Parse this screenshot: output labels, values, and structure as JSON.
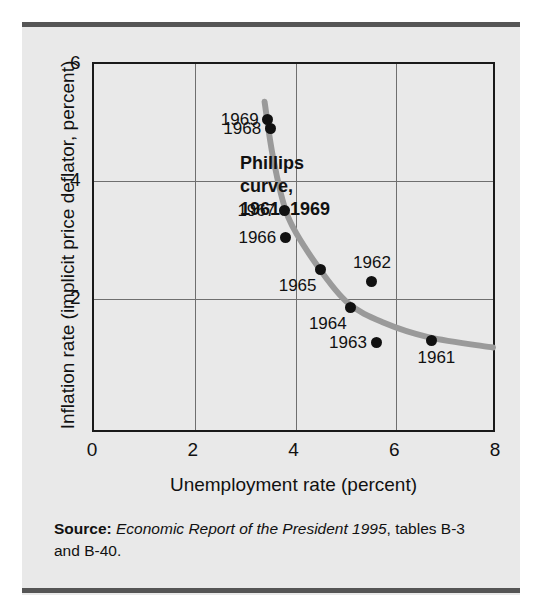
{
  "figure": {
    "source_note": {
      "lead": "Source:",
      "title": "Economic Report of the President 1995",
      "rest": ", tables B-3 and B-40."
    }
  },
  "chart_data": {
    "type": "scatter",
    "title": "",
    "xlabel": "Unemployment rate (percent)",
    "ylabel": "Inflation rate (implicit price deflator, percent)",
    "xlim": [
      0,
      8
    ],
    "ylim": [
      0,
      6
    ],
    "xticks": [
      0,
      2,
      4,
      6,
      8
    ],
    "yticks": [
      2,
      4,
      6
    ],
    "xtick_labels": [
      "0",
      "2",
      "4",
      "6",
      "8"
    ],
    "ytick_labels": [
      "2",
      "4",
      "6"
    ],
    "grid": true,
    "legend": "none",
    "annotations": [
      {
        "name": "phillips-curve-annotation",
        "lines": [
          "Phillips",
          "curve,",
          "1961–1969"
        ],
        "x": 4.5,
        "y": 4.2
      }
    ],
    "series": [
      {
        "name": "Phillips curve points 1961-1969",
        "marker": "filled-circle",
        "color": "#111111",
        "points": [
          {
            "label": "1961",
            "x": 6.7,
            "y": 1.3,
            "label_pos": "below-right"
          },
          {
            "label": "1962",
            "x": 5.5,
            "y": 2.3,
            "label_pos": "above"
          },
          {
            "label": "1963",
            "x": 5.6,
            "y": 1.25,
            "label_pos": "left"
          },
          {
            "label": "1964",
            "x": 5.1,
            "y": 1.85,
            "label_pos": "below-left"
          },
          {
            "label": "1965",
            "x": 4.5,
            "y": 2.5,
            "label_pos": "below-left"
          },
          {
            "label": "1966",
            "x": 3.8,
            "y": 3.05,
            "label_pos": "left"
          },
          {
            "label": "1967",
            "x": 3.78,
            "y": 3.5,
            "label_pos": "left"
          },
          {
            "label": "1968",
            "x": 3.5,
            "y": 4.9,
            "label_pos": "left"
          },
          {
            "label": "1969",
            "x": 3.45,
            "y": 5.05,
            "label_pos": "left"
          }
        ]
      }
    ],
    "fitted_curve": {
      "name": "phillips-curve-line",
      "color": "#9a9a9a",
      "width": 6,
      "path_points": [
        {
          "x": 3.42,
          "y": 5.35
        },
        {
          "x": 3.6,
          "y": 4.35
        },
        {
          "x": 3.9,
          "y": 3.35
        },
        {
          "x": 4.5,
          "y": 2.5
        },
        {
          "x": 5.1,
          "y": 1.88
        },
        {
          "x": 5.8,
          "y": 1.55
        },
        {
          "x": 6.7,
          "y": 1.3
        },
        {
          "x": 8.0,
          "y": 1.12
        }
      ]
    }
  }
}
